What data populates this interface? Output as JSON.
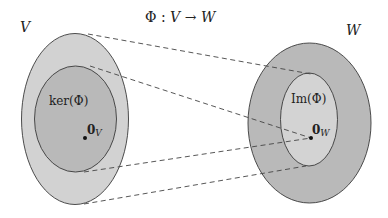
{
  "title": {
    "phi": "Φ",
    "colon": " : ",
    "domain": "V",
    "arrow": " → ",
    "codomain": "W"
  },
  "spaces": {
    "V": {
      "label": "V",
      "fill": "#d2d2d2"
    },
    "W": {
      "label": "W",
      "fill": "#b9b9b9"
    }
  },
  "subspaces": {
    "kernel": {
      "label": "ker(Φ)",
      "fill": "#b9b9b9"
    },
    "image": {
      "label": "Im(Φ)",
      "fill": "#d3d3d3"
    }
  },
  "points": {
    "zero_V": {
      "bold": "0",
      "sub": "V"
    },
    "zero_W": {
      "bold": "0",
      "sub": "W"
    }
  },
  "colors": {
    "stroke": "#3a3a3a",
    "dash": "#444444",
    "text": "#222222"
  }
}
